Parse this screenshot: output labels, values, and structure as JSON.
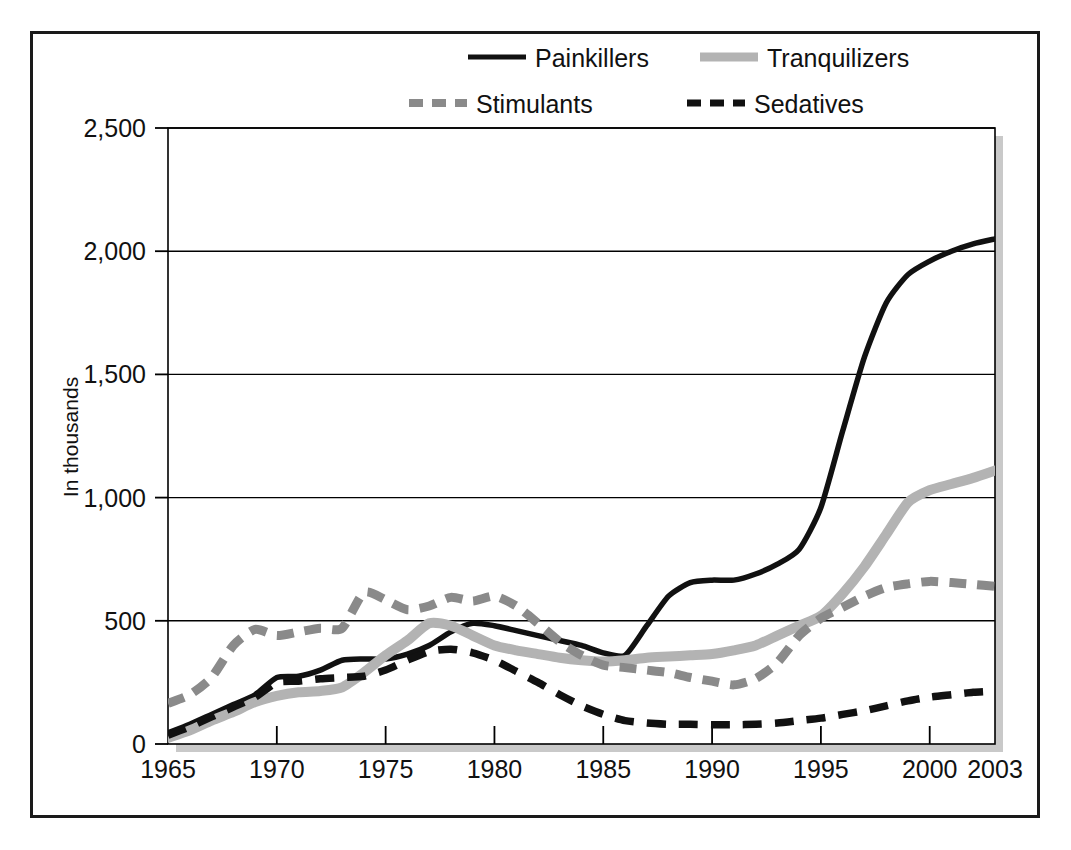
{
  "figure": {
    "y_axis_label": "In thousands",
    "border_color": "#1a1a1a",
    "plot_shadow_color": "#c9c9c9",
    "grid_color": "#000000",
    "background": "#ffffff"
  },
  "legend": {
    "position": "top",
    "entries": [
      {
        "label": "Painkillers",
        "color": "#111111",
        "style": "solid",
        "width": 5,
        "key": "painkillers"
      },
      {
        "label": "Tranquilizers",
        "color": "#b3b3b3",
        "style": "solid",
        "width": 9,
        "key": "tranquilizers"
      },
      {
        "label": "Stimulants",
        "color": "#8a8a8a",
        "style": "dashed",
        "width": 8,
        "key": "stimulants"
      },
      {
        "label": "Sedatives",
        "color": "#111111",
        "style": "dashed",
        "width": 7,
        "key": "sedatives"
      }
    ]
  },
  "chart_data": {
    "type": "line",
    "title": "",
    "subtitle": "",
    "xlabel": "",
    "ylabel": "In thousands",
    "xlim": [
      1965,
      2003
    ],
    "ylim": [
      0,
      2500
    ],
    "yticks": [
      0,
      500,
      1000,
      1500,
      2000,
      2500
    ],
    "ytick_labels": [
      "0",
      "500",
      "1,000",
      "1,500",
      "2,000",
      "2,500"
    ],
    "xticks": [
      1965,
      1970,
      1975,
      1980,
      1985,
      1990,
      1995,
      2000,
      2003
    ],
    "xtick_labels": [
      "1965",
      "1970",
      "1975",
      "1980",
      "1985",
      "1990",
      "1995",
      "2000",
      "2003"
    ],
    "grid": "horizontal",
    "legend_position": "top",
    "x": [
      1965,
      1966,
      1967,
      1968,
      1969,
      1970,
      1971,
      1972,
      1973,
      1974,
      1975,
      1976,
      1977,
      1978,
      1979,
      1980,
      1981,
      1982,
      1983,
      1984,
      1985,
      1986,
      1987,
      1988,
      1989,
      1990,
      1991,
      1992,
      1993,
      1994,
      1995,
      1996,
      1997,
      1998,
      1999,
      2000,
      2001,
      2002,
      2003
    ],
    "series": [
      {
        "name": "Painkillers",
        "color": "#111111",
        "style": "solid",
        "values": [
          45,
          80,
          120,
          160,
          200,
          270,
          275,
          300,
          340,
          345,
          345,
          365,
          400,
          455,
          490,
          480,
          460,
          440,
          420,
          400,
          370,
          360,
          480,
          600,
          655,
          665,
          665,
          690,
          730,
          790,
          960,
          1270,
          1570,
          1790,
          1905,
          1960,
          2000,
          2030,
          2050
        ]
      },
      {
        "name": "Tranquilizers",
        "color": "#b3b3b3",
        "style": "solid",
        "values": [
          25,
          55,
          95,
          130,
          170,
          195,
          210,
          215,
          230,
          290,
          360,
          420,
          490,
          480,
          440,
          400,
          380,
          365,
          350,
          340,
          335,
          340,
          350,
          355,
          360,
          365,
          380,
          400,
          440,
          480,
          520,
          610,
          720,
          850,
          980,
          1030,
          1055,
          1080,
          1110
        ]
      },
      {
        "name": "Stimulants",
        "color": "#8a8a8a",
        "style": "dashed",
        "values": [
          165,
          200,
          270,
          400,
          465,
          440,
          455,
          470,
          470,
          615,
          585,
          545,
          560,
          595,
          580,
          600,
          560,
          490,
          415,
          360,
          320,
          310,
          300,
          290,
          270,
          255,
          240,
          265,
          330,
          440,
          510,
          555,
          600,
          635,
          650,
          660,
          655,
          648,
          640
        ]
      },
      {
        "name": "Sedatives",
        "color": "#111111",
        "style": "dashed",
        "values": [
          35,
          70,
          110,
          150,
          190,
          250,
          255,
          265,
          270,
          275,
          300,
          340,
          375,
          385,
          370,
          340,
          295,
          250,
          200,
          155,
          120,
          95,
          85,
          80,
          80,
          78,
          78,
          80,
          85,
          95,
          105,
          120,
          135,
          155,
          175,
          190,
          200,
          210,
          215
        ]
      }
    ]
  }
}
